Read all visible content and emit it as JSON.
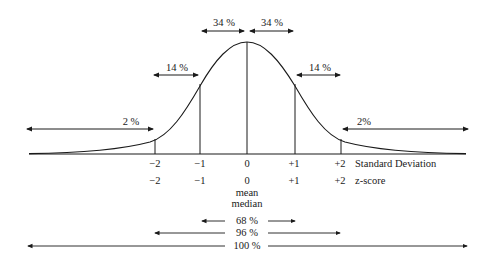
{
  "diagram": {
    "curve_type": "bell-curve",
    "region_labels": {
      "left_tail": "2 %",
      "left_band": "14 %",
      "left_center": "34 %",
      "right_center": "34 %",
      "right_band": "14 %",
      "right_tail": "2%"
    },
    "sd_ticks": [
      "−2",
      "−1",
      "0",
      "+1",
      "+2"
    ],
    "sd_axis_label": "Standard Deviation",
    "z_ticks": [
      "−2",
      "−1",
      "0",
      "+1",
      "+2"
    ],
    "z_axis_label": "z-score",
    "center_labels": [
      "mean",
      "median"
    ],
    "coverage": [
      {
        "label": "68 %",
        "range": "−1 to +1"
      },
      {
        "label": "96 %",
        "range": "−2 to +2"
      },
      {
        "label": "100 %",
        "range": "full"
      }
    ]
  }
}
